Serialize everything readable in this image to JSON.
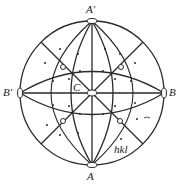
{
  "diagram": {
    "type": "stereographic-projection",
    "labels": {
      "top": "A′",
      "bottom": "A",
      "left": "B′",
      "right": "B",
      "center": "C",
      "pole": "hkl"
    },
    "colors": {
      "ink": "#2a2a2a",
      "background": "#ffffff"
    }
  }
}
